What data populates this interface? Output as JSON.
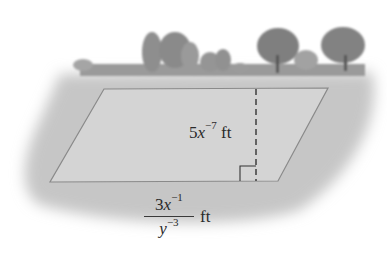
{
  "figure": {
    "height_label": {
      "coef": "5",
      "var": "x",
      "exp": "−7",
      "unit": "ft"
    },
    "base_label": {
      "numerator": {
        "coef": "3",
        "var": "x",
        "exp": "−1"
      },
      "denominator": {
        "var": "y",
        "exp": "−3"
      },
      "unit": "ft"
    },
    "colors": {
      "ground": "#c9c9c9",
      "plot_fill": "#d6d6d6",
      "plot_edge": "#8a8a8a",
      "trees": "#8f8f8f",
      "text": "#2a2a2a"
    }
  }
}
